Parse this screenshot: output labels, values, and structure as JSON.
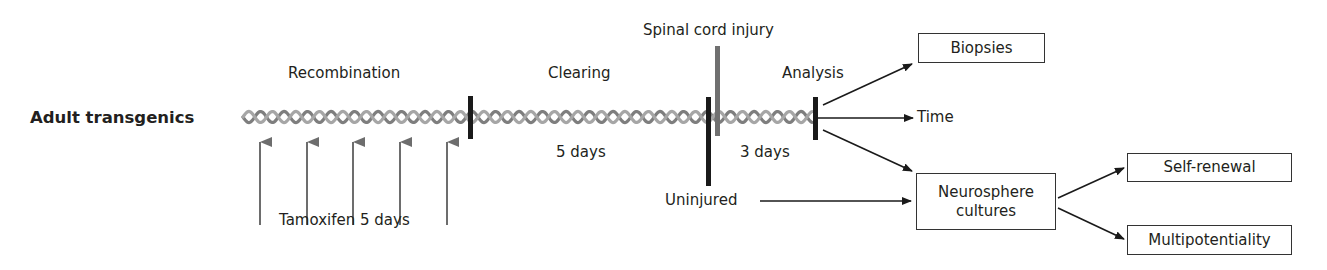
{
  "title": "Adult transgenics",
  "phases": {
    "recombination": "Recombination",
    "clearing": "Clearing",
    "analysis": "Analysis"
  },
  "events": {
    "injury": "Spinal cord injury",
    "uninjured": "Uninjured"
  },
  "durations": {
    "tamoxifen": "Tamoxifen 5 days",
    "clearing": "5 days",
    "post_injury": "3 days"
  },
  "outputs": {
    "biopsies": "Biopsies",
    "time": "Time",
    "neurosphere_line1": "Neurosphere",
    "neurosphere_line2": "cultures",
    "self_renewal": "Self-renewal",
    "multipotentiality": "Multipotentiality"
  },
  "colors": {
    "text": "#231f20",
    "helix": "#8a8a8a",
    "bar": "#1a1a1a",
    "injury_bar": "#707070",
    "tamoxifen_arrow": "#6d6d6d"
  }
}
